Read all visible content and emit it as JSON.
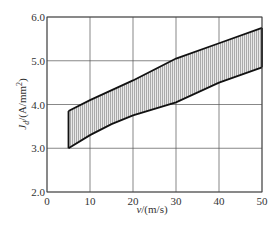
{
  "chart_data": {
    "type": "area",
    "title": "",
    "xlabel": "v/(m/s)",
    "ylabel": "J_d/(A/mm²)",
    "xlim": [
      0,
      50
    ],
    "ylim": [
      2.0,
      6.0
    ],
    "x_ticks": [
      0,
      10,
      20,
      30,
      40,
      50
    ],
    "y_ticks": [
      2.0,
      3.0,
      4.0,
      5.0,
      6.0
    ],
    "x_tick_labels": [
      "0",
      "10",
      "20",
      "30",
      "40",
      "50"
    ],
    "y_tick_labels": [
      "2.0",
      "3.0",
      "4.0",
      "5.0",
      "6.0"
    ],
    "grid": true,
    "legend": null,
    "series": [
      {
        "name": "upper bound",
        "x": [
          5,
          10,
          20,
          30,
          40,
          50
        ],
        "values": [
          3.85,
          4.1,
          4.55,
          5.05,
          5.4,
          5.75
        ]
      },
      {
        "name": "lower bound",
        "x": [
          5,
          10,
          15,
          20,
          30,
          40,
          50
        ],
        "values": [
          3.0,
          3.3,
          3.55,
          3.75,
          4.05,
          4.5,
          4.85
        ]
      }
    ],
    "fill": "hatched band between bounds"
  },
  "labels": {
    "xlabel_v": "v",
    "xlabel_unit": "/(m/s)",
    "ylabel_J": "J",
    "ylabel_sub": "d",
    "ylabel_unit": "/(A/mm",
    "ylabel_sup": "2",
    "ylabel_close": ")"
  }
}
